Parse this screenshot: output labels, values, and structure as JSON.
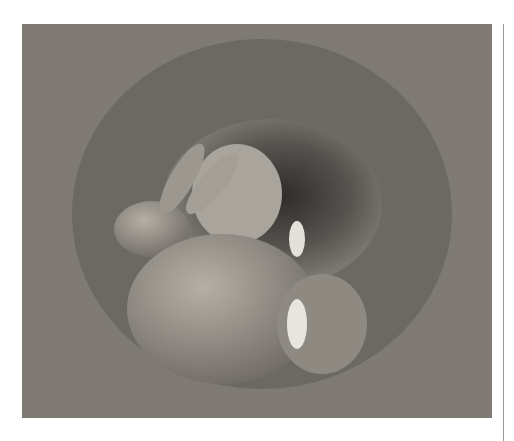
{
  "image": {
    "description": "Black-and-white photograph of young rabbits huddled at the entrance of a burrow in sandy soil",
    "subject": "rabbits in burrow",
    "tones": {
      "dark": "#3a3936",
      "mid": "#8a8780",
      "light": "#d4d1cb"
    }
  }
}
